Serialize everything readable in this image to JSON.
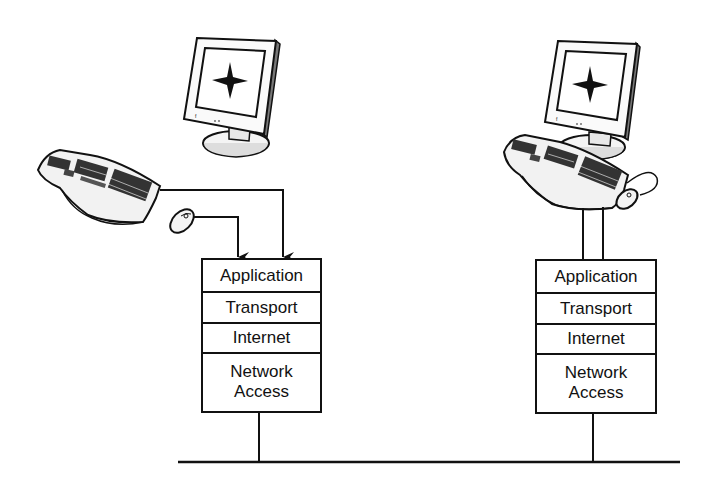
{
  "diagram": {
    "type": "TCP/IP host-to-host communication",
    "hosts": [
      {
        "id": "left-host",
        "arrangement": "peripherals connected via arrows to stack",
        "devices": [
          "monitor",
          "keyboard",
          "mouse"
        ],
        "monitor_screen_symbol": "star",
        "layers": [
          {
            "label": "Application"
          },
          {
            "label": "Transport"
          },
          {
            "label": "Internet"
          },
          {
            "label": "Network\nAccess",
            "line1": "Network",
            "line2": "Access"
          }
        ]
      },
      {
        "id": "right-host",
        "arrangement": "workstation on pedestal above stack",
        "devices": [
          "monitor",
          "keyboard",
          "mouse"
        ],
        "monitor_screen_symbol": "star",
        "layers": [
          {
            "label": "Application"
          },
          {
            "label": "Transport"
          },
          {
            "label": "Internet"
          },
          {
            "label": "Network\nAccess",
            "line1": "Network",
            "line2": "Access"
          }
        ]
      }
    ],
    "network": {
      "type": "shared bus line"
    },
    "colors": {
      "line": "#111111",
      "background": "#ffffff",
      "fill_light": "#f2f2f2"
    }
  }
}
